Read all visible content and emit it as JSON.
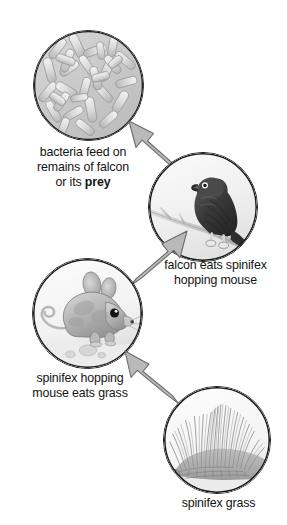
{
  "diagram": {
    "background_color": "#ffffff",
    "text_color": "#141414",
    "arrow_fill": "#b4b4b4",
    "arrow_stroke": "#6e6e6e",
    "circle_stroke": "#1b1b1b"
  },
  "nodes": [
    {
      "id": "bacteria",
      "icon": "bacteria-circle-icon",
      "image_description": "gray field of rod-shaped bacteria, some branched",
      "caption_lines": [
        "bacteria feed on",
        "remains of falcon",
        "or its "
      ],
      "caption_bold_word": "prey",
      "caption_full": "bacteria feed on remains of falcon or its prey"
    },
    {
      "id": "falcon",
      "icon": "falcon-circle-icon",
      "image_description": "dark falcon perched on a branch",
      "caption_lines": [
        "falcon eats spinifex",
        "hopping mouse"
      ],
      "caption_bold_word": "",
      "caption_full": "falcon eats spinifex hopping mouse"
    },
    {
      "id": "mouse",
      "icon": "hopping-mouse-circle-icon",
      "image_description": "gray spinifex hopping mouse with long tail on sand",
      "caption_lines": [
        "spinifex hopping",
        "mouse eats grass"
      ],
      "caption_bold_word": "",
      "caption_full": "spinifex hopping mouse eats grass"
    },
    {
      "id": "grass",
      "icon": "spinifex-grass-circle-icon",
      "image_description": "spiky tussock of spinifex grass",
      "caption_lines": [
        "spinifex grass"
      ],
      "caption_bold_word": "",
      "caption_full": "spinifex grass"
    }
  ],
  "arrows": [
    {
      "id": "grass-to-mouse",
      "icon": "arrow-up-left-icon",
      "from": "grass",
      "to": "mouse",
      "direction": "up-left"
    },
    {
      "id": "mouse-to-falcon",
      "icon": "arrow-up-right-icon",
      "from": "mouse",
      "to": "falcon",
      "direction": "up-right"
    },
    {
      "id": "falcon-to-bacteria",
      "icon": "arrow-up-left-icon",
      "from": "falcon",
      "to": "bacteria",
      "direction": "up-left"
    }
  ]
}
